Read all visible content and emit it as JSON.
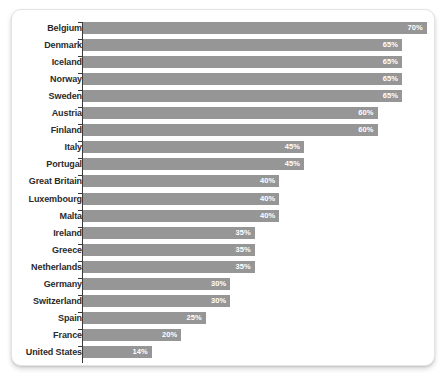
{
  "chart_data": {
    "type": "bar",
    "orientation": "horizontal",
    "title": "",
    "subtitle": "",
    "xlabel": "",
    "ylabel": "",
    "xlim": [
      0,
      70
    ],
    "grid": false,
    "legend": null,
    "value_suffix": "%",
    "bar_color": "#969696",
    "value_label_color": "#ffffff",
    "category_label_color": "#2b2b2b",
    "categories": [
      "Belgium",
      "Denmark",
      "Iceland",
      "Norway",
      "Sweden",
      "Austria",
      "Finland",
      "Italy",
      "Portugal",
      "Great Britain",
      "Luxembourg",
      "Malta",
      "Ireland",
      "Greece",
      "Netherlands",
      "Germany",
      "Switzerland",
      "Spain",
      "France",
      "United States"
    ],
    "values": [
      70,
      65,
      65,
      65,
      65,
      60,
      60,
      45,
      45,
      40,
      40,
      40,
      35,
      35,
      35,
      30,
      30,
      25,
      20,
      14
    ],
    "value_labels": [
      "70%",
      "65%",
      "65%",
      "65%",
      "65%",
      "60%",
      "60%",
      "45%",
      "45%",
      "40%",
      "40%",
      "40%",
      "35%",
      "35%",
      "35%",
      "30%",
      "30%",
      "25%",
      "20%",
      "14%"
    ]
  }
}
